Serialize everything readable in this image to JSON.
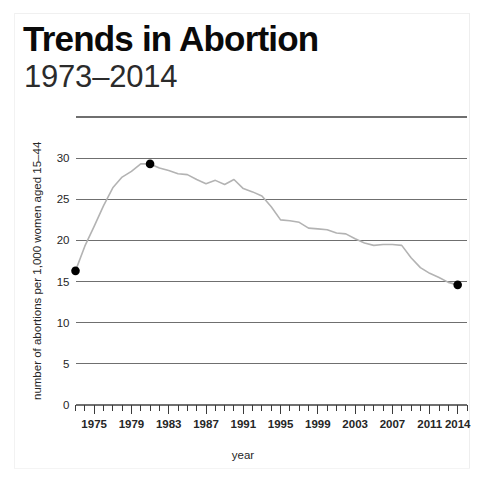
{
  "header": {
    "title": "Trends in Abortion",
    "subtitle": "1973–2014"
  },
  "colors": {
    "line": "#b3b3b3",
    "grid": "#6f6f6f",
    "marker": "#000000",
    "text": "#1a1a1a",
    "background": "#ffffff"
  },
  "chart_data": {
    "type": "line",
    "title": "Trends in Abortion",
    "subtitle": "1973–2014",
    "xlabel": "year",
    "ylabel": "number of abortions per 1,000 women aged 15–44",
    "xlim": [
      1973,
      2015
    ],
    "ylim": [
      0,
      35
    ],
    "grid": true,
    "grid_axis": "y",
    "legend": "none",
    "yticks": [
      0,
      5,
      10,
      15,
      20,
      25,
      30
    ],
    "ytick_labels": [
      "0",
      "5",
      "10",
      "15",
      "20",
      "25",
      "30"
    ],
    "xticks": [
      1975,
      1979,
      1983,
      1987,
      1991,
      1995,
      1999,
      2003,
      2007,
      2011,
      2014
    ],
    "xtick_labels": [
      "1975",
      "1979",
      "1983",
      "1987",
      "1991",
      "1995",
      "1999",
      "2003",
      "2007",
      "2011",
      "2014"
    ],
    "x_minor_tick_interval": 1,
    "series": [
      {
        "name": "abortion rate",
        "x": [
          1973,
          1974,
          1975,
          1976,
          1977,
          1978,
          1979,
          1980,
          1981,
          1982,
          1983,
          1984,
          1985,
          1986,
          1987,
          1988,
          1989,
          1990,
          1991,
          1992,
          1993,
          1994,
          1995,
          1996,
          1997,
          1998,
          1999,
          2000,
          2001,
          2002,
          2003,
          2004,
          2005,
          2006,
          2007,
          2008,
          2009,
          2010,
          2011,
          2012,
          2013,
          2014
        ],
        "y": [
          16.3,
          19.3,
          21.7,
          24.2,
          26.4,
          27.7,
          28.4,
          29.3,
          29.3,
          28.8,
          28.5,
          28.1,
          28.0,
          27.4,
          26.9,
          27.3,
          26.8,
          27.4,
          26.3,
          25.9,
          25.4,
          24.1,
          22.5,
          22.4,
          22.2,
          21.5,
          21.4,
          21.3,
          20.9,
          20.8,
          20.2,
          19.7,
          19.4,
          19.5,
          19.5,
          19.4,
          17.9,
          16.7,
          16.0,
          15.5,
          14.9,
          14.6
        ]
      }
    ],
    "markers": [
      {
        "x": 1973,
        "y": 16.3,
        "label": "start"
      },
      {
        "x": 1981,
        "y": 29.3,
        "label": "peak"
      },
      {
        "x": 2014,
        "y": 14.6,
        "label": "end"
      }
    ]
  }
}
